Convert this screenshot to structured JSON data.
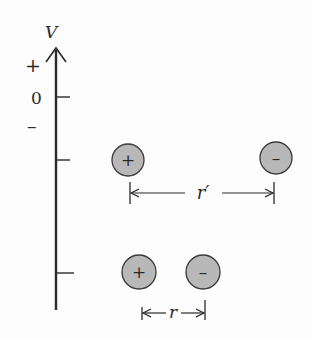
{
  "diagram": {
    "axis": {
      "label": "V",
      "plus_label": "+",
      "zero_label": "0",
      "minus_label": "–"
    },
    "charges": {
      "far_pair": {
        "positive": "+",
        "negative": "–",
        "separation_label": "r′"
      },
      "near_pair": {
        "positive": "+",
        "negative": "–",
        "separation_label": "r"
      }
    },
    "colors": {
      "ink": "#2a2a2a",
      "charge_fill": "#b8b8b8",
      "background": "#fdfdfd"
    }
  }
}
